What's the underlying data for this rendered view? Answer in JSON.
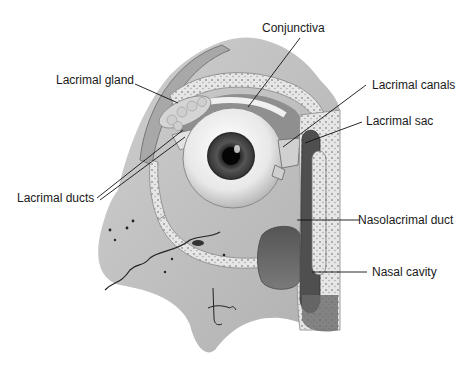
{
  "diagram": {
    "signature": "tina",
    "labels": [
      {
        "id": "conjunctiva",
        "text": "Conjunctiva"
      },
      {
        "id": "lacrimal-gland",
        "text": "Lacrimal gland"
      },
      {
        "id": "lacrimal-canals",
        "text": "Lacrimal canals"
      },
      {
        "id": "lacrimal-sac",
        "text": "Lacrimal sac"
      },
      {
        "id": "lacrimal-ducts",
        "text": "Lacrimal ducts"
      },
      {
        "id": "nasolacrimal-duct",
        "text": "Nasolacrimal duct"
      },
      {
        "id": "nasal-cavity",
        "text": "Nasal cavity"
      }
    ]
  }
}
